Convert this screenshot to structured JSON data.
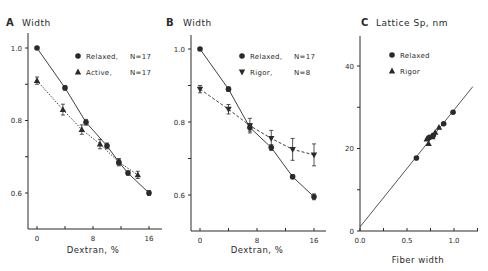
{
  "chart_data": [
    {
      "type": "line",
      "panel": "A",
      "title": "Width",
      "xlabel": "Dextran, %",
      "ylabel": "",
      "xlim": [
        -1,
        17.5
      ],
      "ylim": [
        0.5,
        1.05
      ],
      "xticks": [
        0,
        4,
        8,
        12,
        16
      ],
      "xtick_labels": [
        "0",
        "",
        "8",
        "",
        "16"
      ],
      "yticks": [
        0.6,
        0.7,
        0.8,
        0.9,
        1.0
      ],
      "ytick_labels": [
        "0.6",
        "",
        "0.8",
        "",
        "1.0"
      ],
      "legend_position": "upper right",
      "series": [
        {
          "name": "Relaxed, N=17",
          "legend_label": "Relaxed,",
          "legend_n": "N=17",
          "marker": "circle",
          "line": "solid",
          "x": [
            0,
            4,
            7,
            10,
            11.7,
            13,
            16
          ],
          "values": [
            1.0,
            0.89,
            0.795,
            0.73,
            0.685,
            0.655,
            0.6
          ],
          "error": [
            0,
            0.006,
            0.008,
            0.008,
            0.008,
            0.006,
            0.007
          ]
        },
        {
          "name": "Active, N=17",
          "legend_label": "Active,",
          "legend_n": "N=17",
          "marker": "triangle-up",
          "line": "dotted",
          "x": [
            0,
            3.7,
            6.4,
            9,
            11.7,
            14.4
          ],
          "values": [
            0.91,
            0.83,
            0.775,
            0.735,
            0.685,
            0.65
          ],
          "error": [
            0.01,
            0.015,
            0.013,
            0.013,
            0.01,
            0.01
          ]
        }
      ]
    },
    {
      "type": "line",
      "panel": "B",
      "title": "Width",
      "xlabel": "Dextran, %",
      "ylabel": "",
      "xlim": [
        -1,
        17.5
      ],
      "ylim": [
        0.5,
        1.05
      ],
      "xticks": [
        0,
        4,
        8,
        12,
        16
      ],
      "xtick_labels": [
        "0",
        "",
        "8",
        "",
        "16"
      ],
      "yticks": [
        0.6,
        0.7,
        0.8,
        0.9,
        1.0
      ],
      "ytick_labels": [
        "0.6",
        "",
        "0.8",
        "",
        "1.0"
      ],
      "legend_position": "upper right",
      "series": [
        {
          "name": "Relaxed, N=17",
          "legend_label": "Relaxed,",
          "legend_n": "N=17",
          "marker": "circle",
          "line": "solid",
          "x": [
            0,
            4,
            7,
            10,
            13,
            16
          ],
          "values": [
            1.0,
            0.89,
            0.785,
            0.73,
            0.65,
            0.595
          ],
          "error": [
            0,
            0.006,
            0.01,
            0.008,
            0.006,
            0.008
          ]
        },
        {
          "name": "Rigor, N=8",
          "legend_label": "Rigor,",
          "legend_n": "N=8",
          "marker": "triangle-down",
          "line": "dashed",
          "x": [
            0,
            4,
            7,
            10,
            13,
            16
          ],
          "values": [
            0.89,
            0.835,
            0.79,
            0.755,
            0.725,
            0.71
          ],
          "error": [
            0.01,
            0.013,
            0.02,
            0.022,
            0.03,
            0.03
          ]
        }
      ]
    },
    {
      "type": "scatter",
      "panel": "C",
      "title": "Lattice Sp, nm",
      "xlabel": "Fiber width",
      "ylabel": "",
      "xlim": [
        0,
        1.25
      ],
      "ylim": [
        0,
        47
      ],
      "xticks": [
        0,
        0.25,
        0.5,
        0.75,
        1.0,
        1.25
      ],
      "xtick_labels": [
        "0.0",
        "",
        "0.5",
        "",
        "1.0",
        ""
      ],
      "yticks": [
        0,
        10,
        20,
        30,
        40
      ],
      "ytick_labels": [
        "0",
        "",
        "20",
        "",
        "40"
      ],
      "legend_position": "upper left",
      "fit_line": {
        "x": [
          0,
          1.2
        ],
        "y": [
          1.0,
          35
        ]
      },
      "series": [
        {
          "name": "Relaxed",
          "marker": "circle",
          "x": [
            0.6,
            0.74,
            0.78,
            0.89,
            0.99
          ],
          "values": [
            17.7,
            22.7,
            23.2,
            26.0,
            28.8
          ]
        },
        {
          "name": "Rigor",
          "marker": "triangle-up",
          "x": [
            0.71,
            0.73,
            0.77,
            0.8,
            0.84
          ],
          "values": [
            22.3,
            21.2,
            22.8,
            23.9,
            25.1
          ]
        }
      ]
    }
  ],
  "panels": {
    "A": {
      "letter": "A",
      "title": "Width",
      "xlabel": "Dextran, %"
    },
    "B": {
      "letter": "B",
      "title": "Width",
      "xlabel": "Dextran, %"
    },
    "C": {
      "letter": "C",
      "title": "Lattice Sp, nm",
      "xlabel": "Fiber width"
    }
  },
  "colors": {
    "ink": "#2a2a2a",
    "background": "#ffffff"
  }
}
